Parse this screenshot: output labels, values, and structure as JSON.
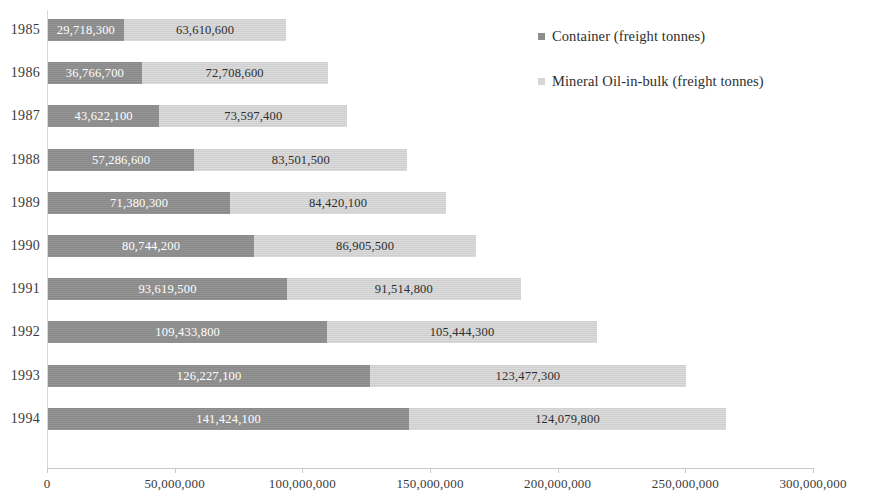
{
  "chart_data": {
    "type": "bar",
    "orientation": "horizontal",
    "stacked": true,
    "title": "",
    "xlabel": "",
    "ylabel": "",
    "xlim": [
      0,
      300000000
    ],
    "grid": false,
    "legend_position": "top-right",
    "categories": [
      "1985",
      "1986",
      "1987",
      "1988",
      "1989",
      "1990",
      "1991",
      "1992",
      "1993",
      "1994"
    ],
    "xticks": [
      0,
      50000000,
      100000000,
      150000000,
      200000000,
      250000000,
      300000000
    ],
    "xtick_labels": [
      "0",
      "50,000,000",
      "100,000,000",
      "150,000,000",
      "200,000,000",
      "250,000,000",
      "300,000,000"
    ],
    "series": [
      {
        "name": "Container (freight tonnes)",
        "color": "#8e8e8e",
        "values": [
          29718300,
          36766700,
          43622100,
          57286600,
          71380300,
          80744200,
          93619500,
          109433800,
          126227100,
          141424100
        ],
        "labels": [
          "29,718,300",
          "36,766,700",
          "43,622,100",
          "57,286,600",
          "71,380,300",
          "80,744,200",
          "93,619,500",
          "109,433,800",
          "126,227,100",
          "141,424,100"
        ]
      },
      {
        "name": "Mineral Oil-in-bulk (freight tonnes)",
        "color": "#d6d6d6",
        "values": [
          63610600,
          72708600,
          73597400,
          83501500,
          84420100,
          86905500,
          91514800,
          105444300,
          123477300,
          124079800
        ],
        "labels": [
          "63,610,600",
          "72,708,600",
          "73,597,400",
          "83,501,500",
          "84,420,100",
          "86,905,500",
          "91,514,800",
          "105,444,300",
          "123,477,300",
          "124,079,800"
        ]
      }
    ]
  },
  "legend": {
    "items": [
      {
        "label": "Container (freight tonnes)",
        "color": "#8e8e8e",
        "marker": "square-marker-icon"
      },
      {
        "label": "Mineral Oil-in-bulk (freight tonnes)",
        "color": "#d6d6d6",
        "marker": "square-marker-icon"
      }
    ]
  }
}
